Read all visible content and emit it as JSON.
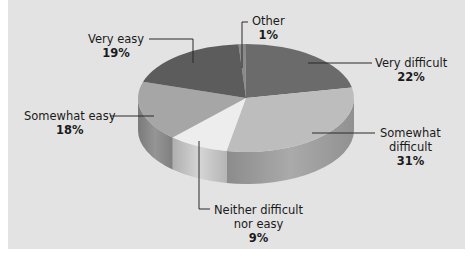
{
  "chart_data": {
    "type": "pie",
    "style": "3d",
    "title": "",
    "categories": [
      "Other",
      "Very difficult",
      "Somewhat difficult",
      "Neither difficult nor easy",
      "Somewhat easy",
      "Very easy"
    ],
    "values": [
      1,
      22,
      31,
      9,
      18,
      19
    ],
    "unit": "%",
    "legend": "none (callout labels)",
    "slice_colors": [
      "#8a8a8a",
      "#6b6b6b",
      "#bdbdbd",
      "#ededed",
      "#a6a6a6",
      "#5c5c5c"
    ]
  },
  "labels": {
    "other": {
      "name": "Other",
      "pct": "1%"
    },
    "very_difficult": {
      "name": "Very difficult",
      "pct": "22%"
    },
    "somewhat_difficult": {
      "name_line1": "Somewhat",
      "name_line2": "difficult",
      "pct": "31%"
    },
    "neither": {
      "name_line1": "Neither difficult",
      "name_line2": "nor easy",
      "pct": "9%"
    },
    "somewhat_easy": {
      "name": "Somewhat easy",
      "pct": "18%"
    },
    "very_easy": {
      "name": "Very easy",
      "pct": "19%"
    }
  },
  "colors": {
    "panel_bg": "#e3e3e3",
    "leader_line": "#2a2a2a"
  }
}
